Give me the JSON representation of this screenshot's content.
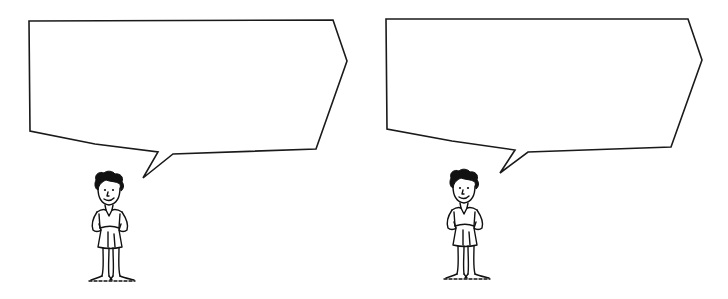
{
  "panels": [
    {
      "id": "left",
      "bubble": {
        "text": "",
        "points": [
          [
            29,
            21
          ],
          [
            333,
            20
          ],
          [
            347,
            61
          ],
          [
            316,
            149
          ],
          [
            173,
            154
          ],
          [
            143,
            178
          ],
          [
            158,
            152
          ],
          [
            95,
            144
          ],
          [
            30,
            131
          ]
        ]
      },
      "figure": {
        "x": 88,
        "y": 170,
        "label": "standing boy with hands on hips"
      }
    },
    {
      "id": "right",
      "bubble": {
        "text": "",
        "points": [
          [
            386,
            19
          ],
          [
            688,
            19
          ],
          [
            702,
            60
          ],
          [
            671,
            147
          ],
          [
            528,
            152
          ],
          [
            500,
            173
          ],
          [
            515,
            150
          ],
          [
            452,
            141
          ],
          [
            387,
            129
          ]
        ]
      },
      "figure": {
        "x": 443,
        "y": 168,
        "label": "standing boy with hands on hips"
      }
    }
  ],
  "colors": {
    "ink": "#111111",
    "background": "#ffffff"
  }
}
